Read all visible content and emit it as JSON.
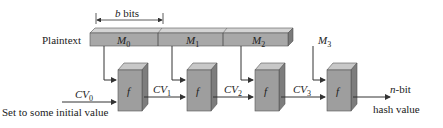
{
  "diagram": {
    "width_label": "bits",
    "width_var": "b",
    "plaintext_label": "Plaintext",
    "blocks": [
      {
        "name": "M",
        "sub": "0"
      },
      {
        "name": "M",
        "sub": "1"
      },
      {
        "name": "M",
        "sub": "2"
      },
      {
        "name": "M",
        "sub": "3"
      }
    ],
    "function_label": "f",
    "chain_values": [
      {
        "name": "CV",
        "sub": "0"
      },
      {
        "name": "CV",
        "sub": "1"
      },
      {
        "name": "CV",
        "sub": "2"
      },
      {
        "name": "CV",
        "sub": "3"
      }
    ],
    "initial_value_label": "Set to some initial value",
    "output_label_var": "n",
    "output_label_line1": "-bit",
    "output_label_line2": "hash value",
    "colors": {
      "block_fill": "#a9a9a9",
      "block_top": "#d6d6d6",
      "box_front": "#9e9e9e",
      "box_side": "#7d7d7d",
      "box_top": "#c8c8c8",
      "line": "#333333"
    }
  }
}
